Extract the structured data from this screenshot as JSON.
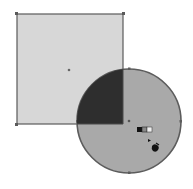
{
  "canvas": {
    "width": 193,
    "height": 189,
    "background": "#ffffff"
  },
  "shapes": {
    "rectangle": {
      "x": 17,
      "y": 14,
      "width": 106,
      "height": 110,
      "fill": "#d7d7d7",
      "stroke": "#5a5a5a",
      "center": [
        69,
        70
      ]
    },
    "circle": {
      "cx": 129,
      "cy": 121,
      "r": 52,
      "fill": "#a9a9a9",
      "stroke": "#5c5c5c"
    },
    "intersection": {
      "fill": "#2e2e2e"
    }
  },
  "cursor": {
    "name": "shape-builder-cursor",
    "swatches": [
      "#111111",
      "#888888",
      "#eeeeee"
    ]
  }
}
